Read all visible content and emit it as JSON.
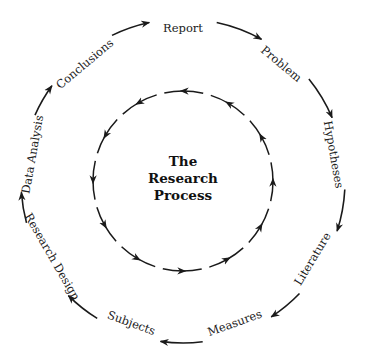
{
  "diagram": {
    "title_lines": [
      "The",
      "Research",
      "Process"
    ],
    "outer_cycle": {
      "direction": "clockwise",
      "steps": [
        "Report",
        "Problem",
        "Hypotheses",
        "Literature",
        "Measures",
        "Subjects",
        "Research Design",
        "Data Analysis",
        "Conclusions"
      ]
    },
    "inner_cycle": {
      "direction": "counterclockwise",
      "arrow_count": 12
    },
    "colors": {
      "line": "#1a1a1a",
      "text": "#222222",
      "background": "#ffffff"
    }
  }
}
